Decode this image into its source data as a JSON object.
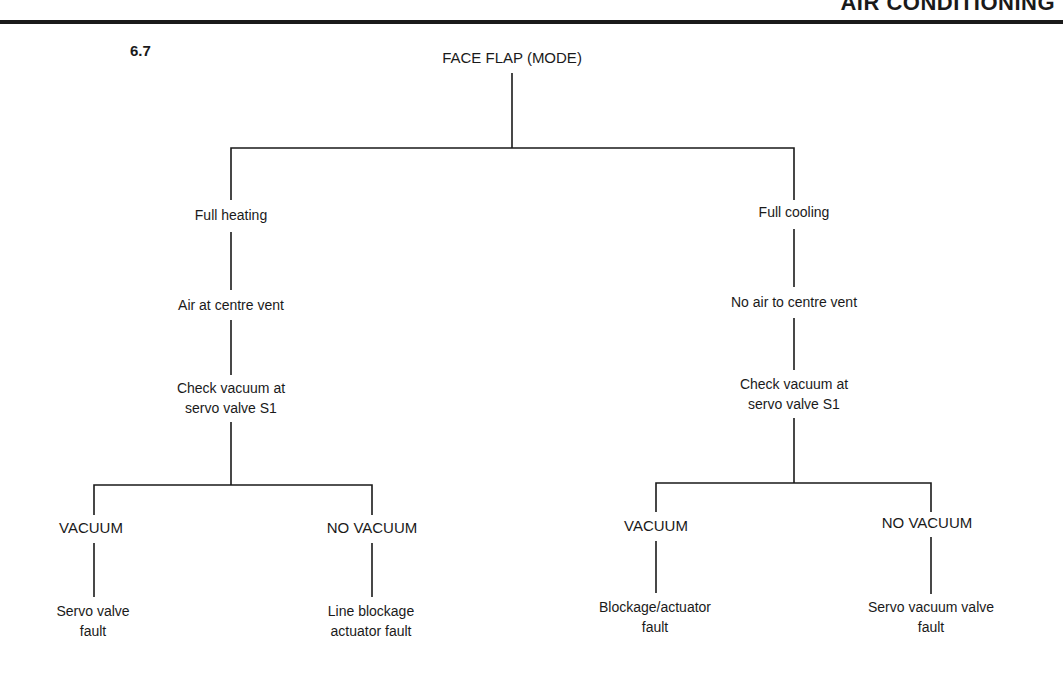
{
  "header": {
    "title": "AIR CONDITIONING"
  },
  "figure": {
    "number": "6.7"
  },
  "tree": {
    "root": "FACE FLAP (MODE)",
    "left": {
      "condition": "Full heating",
      "symptom": "Air at centre vent",
      "check_line1": "Check vacuum at",
      "check_line2": "servo valve S1",
      "vacuum": {
        "label": "VACUUM",
        "result_line1": "Servo valve",
        "result_line2": "fault"
      },
      "no_vacuum": {
        "label": "NO VACUUM",
        "result_line1": "Line blockage",
        "result_line2": "actuator fault"
      }
    },
    "right": {
      "condition": "Full cooling",
      "symptom": "No air to centre vent",
      "check_line1": "Check vacuum at",
      "check_line2": "servo valve S1",
      "vacuum": {
        "label": "VACUUM",
        "result_line1": "Blockage/actuator",
        "result_line2": "fault"
      },
      "no_vacuum": {
        "label": "NO VACUUM",
        "result_line1": "Servo vacuum valve",
        "result_line2": "fault"
      }
    }
  }
}
